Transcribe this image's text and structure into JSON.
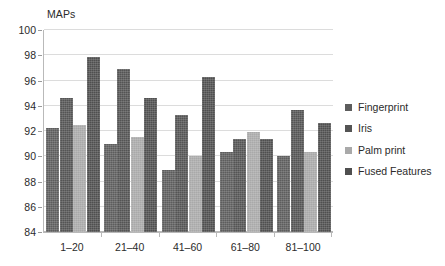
{
  "chart_data": {
    "type": "bar",
    "title": "",
    "xlabel": "",
    "ylabel": "MAPs",
    "ylim": [
      84,
      100
    ],
    "ytick_step": 2,
    "yticks": [
      100,
      98,
      96,
      94,
      92,
      90,
      88,
      86,
      84
    ],
    "grid": "horizontal",
    "legend_position": "right",
    "categories": [
      "1–20",
      "21–40",
      "41–60",
      "61–80",
      "81–100"
    ],
    "series": [
      {
        "name": "Fingerprint",
        "color": "#5d5d5d",
        "values": [
          92.2,
          91.0,
          88.9,
          90.3,
          90.0
        ]
      },
      {
        "name": "Iris",
        "color": "#545454",
        "values": [
          94.6,
          96.9,
          93.3,
          91.4,
          93.7
        ]
      },
      {
        "name": "Palm print",
        "color": "#a9a9a9",
        "values": [
          92.5,
          91.5,
          90.0,
          91.9,
          90.3
        ]
      },
      {
        "name": "Fused Features",
        "color": "#4f4f4f",
        "values": [
          97.9,
          94.6,
          96.3,
          91.4,
          92.6
        ]
      }
    ]
  },
  "legend": {
    "items": [
      {
        "label": "Fingerprint"
      },
      {
        "label": "Iris"
      },
      {
        "label": "Palm print"
      },
      {
        "label": "Fused Features"
      }
    ]
  },
  "axes": {
    "y_title": "MAPs"
  }
}
